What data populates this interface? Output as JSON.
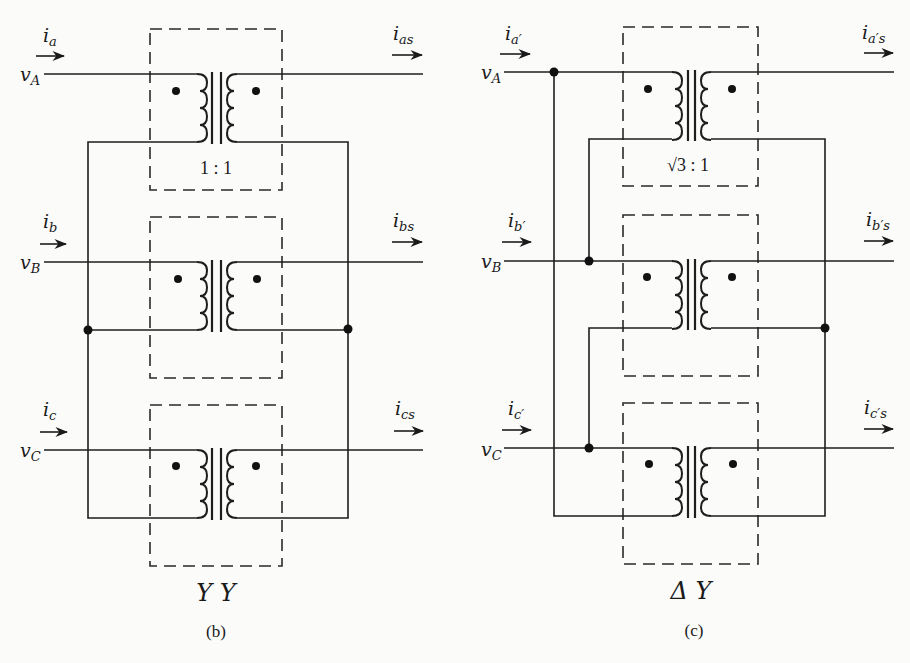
{
  "diagram_b": {
    "caption": "(b)",
    "config_label": "Y Y",
    "turns_ratio": "1 : 1",
    "phases": [
      {
        "input_current": "i",
        "input_sub": "a",
        "voltage": "v",
        "voltage_sub": "A",
        "output_current": "i",
        "output_sub": "as"
      },
      {
        "input_current": "i",
        "input_sub": "b",
        "voltage": "v",
        "voltage_sub": "B",
        "output_current": "i",
        "output_sub": "bs"
      },
      {
        "input_current": "i",
        "input_sub": "c",
        "voltage": "v",
        "voltage_sub": "C",
        "output_current": "i",
        "output_sub": "cs"
      }
    ]
  },
  "diagram_c": {
    "caption": "(c)",
    "config_label": "Δ Y",
    "turns_ratio_root": "√3",
    "turns_ratio_rest": " : 1",
    "phases": [
      {
        "input_current": "i",
        "input_sub": "a′",
        "voltage": "v",
        "voltage_sub": "A",
        "output_current": "i",
        "output_sub": "a′s"
      },
      {
        "input_current": "i",
        "input_sub": "b′",
        "voltage": "v",
        "voltage_sub": "B",
        "output_current": "i",
        "output_sub": "b′s"
      },
      {
        "input_current": "i",
        "input_sub": "c′",
        "voltage": "v",
        "voltage_sub": "C",
        "output_current": "i",
        "output_sub": "c′s"
      }
    ]
  },
  "colors": {
    "ink": "#1e1e1e",
    "paper": "#fbfbfa"
  }
}
